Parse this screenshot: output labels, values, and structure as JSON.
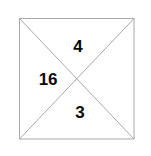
{
  "figure": {
    "type": "geometry-diagram",
    "shape": "square-with-both-diagonals",
    "background_color": "#ffffff",
    "line_color": "#a9a9a9",
    "line_width": 1,
    "text_color": "#0a0a0a",
    "square": {
      "left": 19,
      "top": 18,
      "right": 134,
      "bottom": 139,
      "width": 115,
      "height": 121
    },
    "diagonals": [
      {
        "name": "diagonal-top-left-to-bottom-right",
        "x1": 19,
        "y1": 18,
        "x2": 134,
        "y2": 139
      },
      {
        "name": "diagonal-top-right-to-bottom-left",
        "x1": 134,
        "y1": 18,
        "x2": 19,
        "y2": 139
      }
    ],
    "intersection": {
      "x": 77,
      "y": 79
    },
    "labels": {
      "top": "4",
      "left": "16",
      "bottom": "3"
    }
  }
}
